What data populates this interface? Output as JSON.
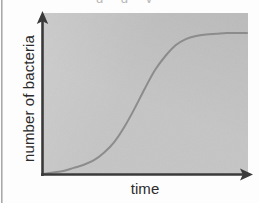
{
  "figure": {
    "width": 259,
    "height": 203,
    "background_color": "#fdfdfd",
    "panel_color": "#c5c5c5",
    "axis_color": "#3a3a3a",
    "curve_color": "#8c8c8c",
    "label_color": "#2b2b2b",
    "cropped_caption_text": "g g y"
  },
  "chart_data": {
    "type": "line",
    "title": "",
    "subtitle": "",
    "xlabel": "time",
    "ylabel": "number of bacteria",
    "grid": false,
    "legend": null,
    "legend_position": "none",
    "axis_arrows": {
      "x": "right",
      "y": "up"
    },
    "xlim": [
      0,
      1
    ],
    "ylim": [
      0,
      1
    ],
    "xticks": [],
    "yticks": [],
    "xticklabels": [],
    "yticklabels": [],
    "annotations": [],
    "series": [
      {
        "name": "bacterial growth",
        "shape": "sigmoid",
        "color": "#8c8c8c",
        "linewidth": 2,
        "x": [
          0.0,
          0.05,
          0.1,
          0.15,
          0.2,
          0.25,
          0.3,
          0.35,
          0.4,
          0.45,
          0.5,
          0.55,
          0.6,
          0.65,
          0.7,
          0.75,
          0.8,
          0.85,
          0.9,
          0.95,
          1.0
        ],
        "y": [
          0.0,
          0.01,
          0.02,
          0.04,
          0.06,
          0.09,
          0.14,
          0.21,
          0.31,
          0.43,
          0.56,
          0.68,
          0.77,
          0.84,
          0.88,
          0.9,
          0.91,
          0.915,
          0.92,
          0.92,
          0.92
        ]
      }
    ]
  },
  "axes": {
    "y_axis_name": "y-axis",
    "x_axis_name": "x-axis"
  }
}
